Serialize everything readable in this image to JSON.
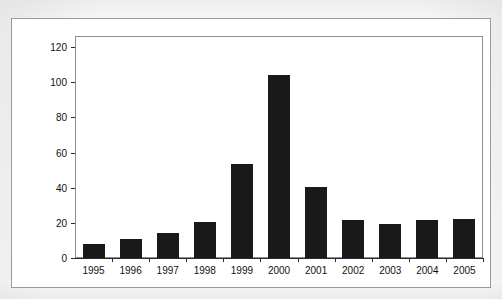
{
  "figure": {
    "background_color": "#f7f7f7",
    "frame_color": "#9a9a9a",
    "plot_frame_color": "#8d8d8d",
    "bar_color": "#191919",
    "text_color": "#111111"
  },
  "chart_data": {
    "type": "bar",
    "title": "",
    "xlabel": "",
    "ylabel": "$ Billion invested",
    "categories": [
      "1995",
      "1996",
      "1997",
      "1998",
      "1999",
      "2000",
      "2001",
      "2002",
      "2003",
      "2004",
      "2005"
    ],
    "values": [
      7.8,
      10.8,
      14.3,
      20.5,
      53.5,
      104.0,
      40.4,
      21.5,
      19.5,
      21.5,
      22.0
    ],
    "ylim": [
      0,
      128
    ],
    "y_ticks": [
      0,
      20,
      40,
      60,
      80,
      100,
      120
    ],
    "y_tick_labels": [
      "0",
      "20",
      "40",
      "60",
      "80",
      "100",
      "120"
    ],
    "xlim_note": "categorical",
    "grid": false,
    "legend": null,
    "legend_position": "none",
    "series": [
      {
        "name": "$ Billion invested",
        "values": [
          7.8,
          10.8,
          14.3,
          20.5,
          53.5,
          104.0,
          40.4,
          21.5,
          19.5,
          21.5,
          22.0
        ]
      }
    ]
  }
}
